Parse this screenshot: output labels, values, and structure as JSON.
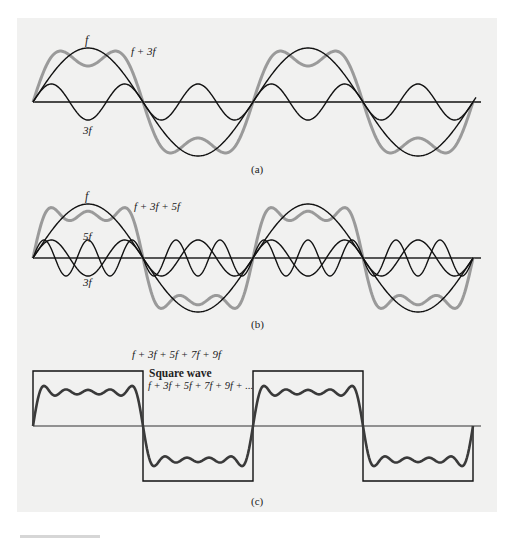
{
  "figure": {
    "panel_color": "#f1f1f0",
    "line_color": "#111111",
    "sum_color_ab": "#9a9a9a",
    "sum_color_c": "#3a3a3a",
    "panels": [
      {
        "id": "a",
        "caption": "(a)",
        "labels": {
          "fundamental": "f",
          "harmonic3": "3f",
          "sum": "f + 3f"
        },
        "components": [
          1,
          3
        ]
      },
      {
        "id": "b",
        "caption": "(b)",
        "labels": {
          "fundamental": "f",
          "harmonic3": "3f",
          "harmonic5": "5f",
          "sum": "f + 3f + 5f"
        },
        "components": [
          1,
          3,
          5
        ]
      },
      {
        "id": "c",
        "caption": "(c)",
        "labels": {
          "sum": "f + 3f + 5f + 7f + 9f",
          "square_title": "Square wave",
          "square_series": "f + 3f + 5f + 7f + 9f + ..."
        },
        "components": [
          1,
          3,
          5,
          7,
          9
        ]
      }
    ]
  },
  "chart_data": [
    {
      "type": "line",
      "title": "(a)",
      "series": [
        {
          "name": "f",
          "frequency": 1,
          "amplitude": 1.0
        },
        {
          "name": "3f",
          "frequency": 3,
          "amplitude": 0.333
        },
        {
          "name": "f + 3f",
          "frequency": "1+3",
          "style": "gray thick"
        }
      ],
      "x_range_periods": [
        0,
        2
      ],
      "axis": "horizontal zero line only"
    },
    {
      "type": "line",
      "title": "(b)",
      "series": [
        {
          "name": "f",
          "frequency": 1,
          "amplitude": 1.0
        },
        {
          "name": "3f",
          "frequency": 3,
          "amplitude": 0.333
        },
        {
          "name": "5f",
          "frequency": 5,
          "amplitude": 0.333
        },
        {
          "name": "f + 3f + 5f",
          "frequency": "1+3+5",
          "style": "gray thick"
        }
      ],
      "x_range_periods": [
        0,
        2
      ],
      "axis": "horizontal zero line only"
    },
    {
      "type": "line",
      "title": "(c)",
      "series": [
        {
          "name": "f + 3f + 5f + 7f + 9f",
          "frequency": "1+3+5+7+9",
          "style": "dark thick"
        },
        {
          "name": "Square wave f + 3f + 5f + 7f + 9f + ...",
          "style": "thin square"
        }
      ],
      "x_range_periods": [
        0,
        2
      ],
      "axis": "horizontal zero line only"
    }
  ]
}
